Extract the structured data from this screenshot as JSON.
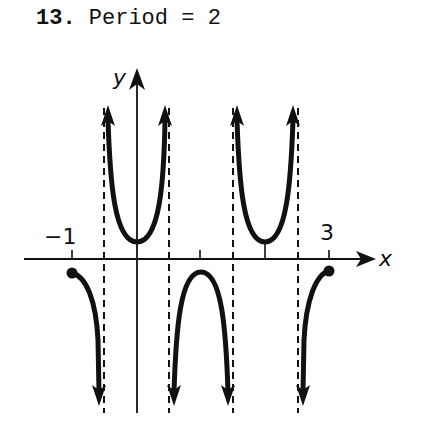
{
  "problem": {
    "number": "13.",
    "statement": "Period = 2"
  },
  "graph": {
    "x_axis_label": "x",
    "y_axis_label": "y",
    "tick_labels": {
      "left": "−1",
      "right": "3"
    },
    "function": "cosecant-like / secant-type curve with period 2",
    "asymptotes_x": [
      -0.5,
      0.5,
      1.5,
      2.5
    ],
    "domain_shown": [
      -1,
      3
    ],
    "endpoints": [
      {
        "x": -1,
        "y": -1,
        "closed": true
      },
      {
        "x": 3,
        "y": -1,
        "closed": true
      }
    ],
    "upper_branch_minima": [
      {
        "x": 0,
        "y": 1
      },
      {
        "x": 2,
        "y": 1
      }
    ],
    "lower_branch_maxima": [
      {
        "x": 1,
        "y": -1
      }
    ],
    "colors": {
      "curve": "#111111",
      "axis": "#111111",
      "asymptote": "#111111",
      "background": "#ffffff"
    }
  }
}
